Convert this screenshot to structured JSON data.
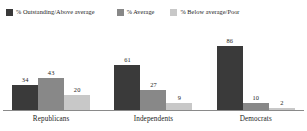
{
  "chart_data": {
    "type": "bar",
    "title": "",
    "xlabel": "",
    "ylabel": "",
    "ylim": [
      0,
      100
    ],
    "grid": false,
    "legend_position": "top-left",
    "categories": [
      "Republicans",
      "Independents",
      "Democrats"
    ],
    "series": [
      {
        "name": "% Outstanding/Above average",
        "color": "#3a3a3a",
        "values": [
          34,
          61,
          86
        ],
        "labels": [
          "34",
          "61",
          "86"
        ]
      },
      {
        "name": "% Average",
        "color": "#888888",
        "values": [
          43,
          27,
          10
        ],
        "labels": [
          "43",
          "27",
          "10"
        ]
      },
      {
        "name": "% Below average/Poor",
        "color": "#c8c8c8",
        "values": [
          20,
          9,
          2
        ],
        "labels": [
          "20",
          "9",
          "2"
        ]
      }
    ]
  },
  "legend": {
    "items": [
      {
        "label": "% Outstanding/Above average",
        "color": "#3a3a3a"
      },
      {
        "label": "% Average",
        "color": "#888888"
      },
      {
        "label": "% Below average/Poor",
        "color": "#c8c8c8"
      }
    ]
  },
  "axis": {
    "baseline_color": "#8a8a8a"
  },
  "background_color": "#ffffff"
}
